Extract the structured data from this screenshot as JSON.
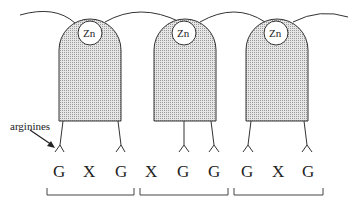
{
  "diagram": {
    "type": "zinc-finger-protein-dna-binding",
    "fingers": [
      {
        "metal_label": "Zn",
        "triplet": [
          "G",
          "X",
          "G"
        ]
      },
      {
        "metal_label": "Zn",
        "triplet": [
          "X",
          "G",
          "G"
        ]
      },
      {
        "metal_label": "Zn",
        "triplet": [
          "G",
          "X",
          "G"
        ]
      }
    ],
    "annotation": "arginines",
    "sequence": [
      "G",
      "X",
      "G",
      "X",
      "G",
      "G",
      "G",
      "X",
      "G"
    ],
    "colors": {
      "finger_fill": "#d4d4d4",
      "stroke": "#333333",
      "background": "#ffffff"
    }
  }
}
